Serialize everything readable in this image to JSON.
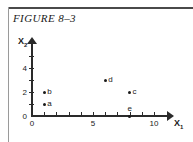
{
  "figure": {
    "title": "FIGURE 8–3"
  },
  "axes": {
    "x_name": "X",
    "x_sub": "1",
    "y_name": "X",
    "y_sub": "2",
    "x_ticks": [
      {
        "value": 0,
        "label": "0"
      },
      {
        "value": 1,
        "label": ""
      },
      {
        "value": 2,
        "label": ""
      },
      {
        "value": 3,
        "label": ""
      },
      {
        "value": 4,
        "label": ""
      },
      {
        "value": 5,
        "label": "5"
      },
      {
        "value": 6,
        "label": ""
      },
      {
        "value": 7,
        "label": ""
      },
      {
        "value": 8,
        "label": ""
      },
      {
        "value": 9,
        "label": ""
      },
      {
        "value": 10,
        "label": "10"
      }
    ],
    "y_ticks": [
      {
        "value": 0,
        "label": "0"
      },
      {
        "value": 1,
        "label": ""
      },
      {
        "value": 2,
        "label": "2"
      },
      {
        "value": 3,
        "label": ""
      },
      {
        "value": 4,
        "label": "4"
      },
      {
        "value": 5,
        "label": ""
      }
    ]
  },
  "chart_data": {
    "type": "scatter",
    "title": "FIGURE 8–3",
    "xlabel": "X1",
    "ylabel": "X2",
    "xlim": [
      0,
      10
    ],
    "ylim": [
      0,
      5
    ],
    "grid": false,
    "legend": "none",
    "points": [
      {
        "label": "a",
        "x": 1,
        "y": 1
      },
      {
        "label": "b",
        "x": 1,
        "y": 2
      },
      {
        "label": "c",
        "x": 8,
        "y": 2
      },
      {
        "label": "d",
        "x": 6,
        "y": 3
      },
      {
        "label": "e",
        "x": 8,
        "y": 0
      }
    ]
  }
}
